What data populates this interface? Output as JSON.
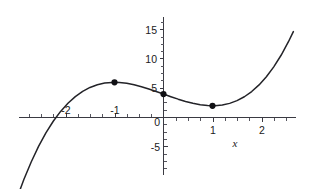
{
  "chart_data": {
    "type": "line",
    "title": "",
    "subtitle": "",
    "xlabel": "x",
    "ylabel": "",
    "equation": "x^3 - 3x + 4",
    "xlim": [
      -2.97,
      2.65
    ],
    "ylim": [
      -7.2,
      17.3
    ],
    "xticks": [
      -2,
      -1,
      0,
      1,
      2
    ],
    "xtick_labels": [
      "-2",
      "-1",
      "0",
      "1",
      "2"
    ],
    "yticks": [
      -5,
      0,
      5,
      10,
      15
    ],
    "ytick_labels": [
      "-5",
      "0",
      "5",
      "10",
      "15"
    ],
    "x_minor_tick_step": 0.25,
    "y_minor_tick_step": 1.25,
    "grid": false,
    "legend": false,
    "series": [
      {
        "name": "f(x) = x^3 - 3x + 4",
        "color": "#232328",
        "x": [
          -2.97,
          -2.85,
          -2.7,
          -2.55,
          -2.4,
          -2.25,
          -2.1,
          -1.95,
          -1.8,
          -1.65,
          -1.5,
          -1.35,
          -1.2,
          -1.05,
          -1.0,
          -0.9,
          -0.75,
          -0.6,
          -0.45,
          -0.3,
          -0.15,
          0.0,
          0.15,
          0.3,
          0.45,
          0.6,
          0.75,
          0.9,
          1.0,
          1.05,
          1.2,
          1.35,
          1.5,
          1.65,
          1.8,
          1.95,
          2.1,
          2.25,
          2.4,
          2.55,
          2.65
        ],
        "y": [
          -13.29,
          -10.59,
          -7.59,
          -4.93,
          -2.62,
          -0.64,
          1.04,
          2.44,
          3.57,
          4.46,
          5.13,
          5.59,
          5.87,
          5.99,
          6.0,
          5.97,
          5.83,
          5.58,
          5.26,
          4.87,
          4.45,
          4.0,
          3.55,
          3.13,
          2.74,
          2.42,
          2.17,
          2.03,
          2.0,
          2.01,
          2.13,
          2.41,
          2.88,
          3.54,
          4.43,
          5.56,
          6.96,
          8.64,
          10.62,
          12.93,
          14.65
        ]
      }
    ],
    "points": [
      {
        "label": "local-maximum",
        "x": -1,
        "y": 6
      },
      {
        "label": "y-intercept",
        "x": 0,
        "y": 4
      },
      {
        "label": "local-minimum",
        "x": 1,
        "y": 2
      }
    ],
    "colors": {
      "curve": "#232328",
      "axis": "#3a3a42",
      "point": "#111115",
      "text": "#1a1a1a",
      "background": "#ffffff"
    }
  }
}
